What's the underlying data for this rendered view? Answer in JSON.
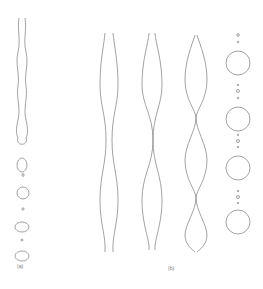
{
  "figure": {
    "panels": [
      {
        "label": "(a)",
        "description": "Jet thinning and breaking into droplets with small satellite drops"
      },
      {
        "label": "(b)",
        "description": "Three varicose jets with growing perturbation and a column of large drops with satellites"
      }
    ],
    "stroke_color": "#888888"
  }
}
